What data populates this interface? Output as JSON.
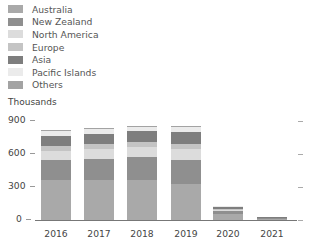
{
  "legend": [
    {
      "label": "Australia",
      "color": "#a9a9a9"
    },
    {
      "label": "New Zealand",
      "color": "#8f8f8f"
    },
    {
      "label": "North America",
      "color": "#dcdcdc"
    },
    {
      "label": "Europe",
      "color": "#c4c4c4"
    },
    {
      "label": "Asia",
      "color": "#7e7e7e"
    },
    {
      "label": "Pacific Islands",
      "color": "#ebebeb"
    },
    {
      "label": "Others",
      "color": "#a3a3a3"
    }
  ],
  "unit_label": "Thousands",
  "y_ticks": [
    "900",
    "600",
    "300",
    "0"
  ],
  "chart_data": {
    "type": "bar",
    "stacked": true,
    "title": "",
    "xlabel": "",
    "ylabel": "Thousands",
    "ylim": [
      0,
      900
    ],
    "y_ticks": [
      0,
      300,
      600,
      900
    ],
    "grid": false,
    "legend_position": "top-left",
    "categories": [
      "2016",
      "2017",
      "2018",
      "2019",
      "2020",
      "2021"
    ],
    "series": [
      {
        "name": "Australia",
        "color": "#a9a9a9",
        "values": [
          365,
          360,
          365,
          330,
          50,
          12
        ]
      },
      {
        "name": "New Zealand",
        "color": "#8f8f8f",
        "values": [
          180,
          195,
          205,
          220,
          30,
          5
        ]
      },
      {
        "name": "North America",
        "color": "#dcdcdc",
        "values": [
          85,
          95,
          95,
          100,
          15,
          3
        ]
      },
      {
        "name": "Europe",
        "color": "#c4c4c4",
        "values": [
          40,
          40,
          40,
          40,
          5,
          1
        ]
      },
      {
        "name": "Asia",
        "color": "#7e7e7e",
        "values": [
          95,
          95,
          100,
          110,
          20,
          2
        ]
      },
      {
        "name": "Pacific Islands",
        "color": "#ebebeb",
        "values": [
          45,
          45,
          40,
          45,
          5,
          1
        ]
      },
      {
        "name": "Others",
        "color": "#a3a3a3",
        "values": [
          10,
          10,
          10,
          10,
          5,
          1
        ]
      }
    ]
  }
}
